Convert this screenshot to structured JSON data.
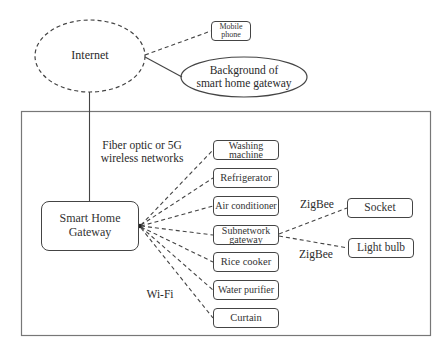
{
  "nodes": {
    "internet": "Internet",
    "mobile_phone": "Mobile phone",
    "background": "Background of smart home gateway",
    "background_line1": "Background of",
    "background_line2": "smart home gateway",
    "gateway_line1": "Smart Home",
    "gateway_line2": "Gateway",
    "mobile_line1": "Mobile",
    "mobile_line2": "phone"
  },
  "links": {
    "uplink_line1": "Fiber optic or 5G",
    "uplink_line2": "wireless networks",
    "wifi": "Wi-Fi",
    "zigbee_socket": "ZigBee",
    "zigbee_bulb": "ZigBee"
  },
  "devices": [
    {
      "line1": "Washing",
      "line2": "machine"
    },
    {
      "label": "Refrigerator"
    },
    {
      "label": "Air conditioner"
    },
    {
      "line1": "Subnetwork",
      "line2": "gateway"
    },
    {
      "label": "Rice cooker"
    },
    {
      "label": "Water purifier"
    },
    {
      "label": "Curtain"
    }
  ],
  "subdevices": [
    {
      "label": "Socket"
    },
    {
      "label": "Light bulb"
    }
  ],
  "colors": {
    "stroke": "#444444",
    "text": "#2a2a2a",
    "background": "#ffffff"
  }
}
